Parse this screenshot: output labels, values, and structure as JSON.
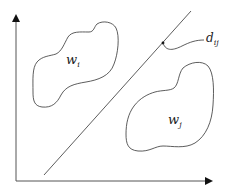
{
  "diagram": {
    "type": "decision-boundary",
    "colors": {
      "stroke": "#333333",
      "background": "#ffffff"
    },
    "axes": {
      "x_axis": "horizontal-arrow",
      "y_axis": "vertical-arrow"
    },
    "regions": [
      {
        "label_main": "w",
        "label_sub": "i"
      },
      {
        "label_main": "w",
        "label_sub": "j"
      }
    ],
    "boundary": {
      "label_main": "d",
      "label_sub": "ij"
    }
  }
}
